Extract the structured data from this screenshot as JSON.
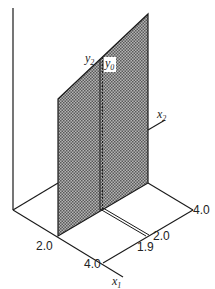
{
  "figure": {
    "colors": {
      "line": "#1a1a1a",
      "plane_fill": "#9a9a9a",
      "background": "#ffffff"
    },
    "labels": {
      "y2": {
        "base": "y",
        "sub": "2"
      },
      "y0": {
        "base": "y",
        "sub": "0"
      },
      "x2": {
        "base": "x",
        "sub": "2"
      },
      "x1": {
        "base": "x",
        "sub": "1"
      },
      "front_tick_2": "2.0",
      "front_tick_4": "4.0",
      "right_tick_4": "4.0",
      "right_tick_2": "2.0",
      "right_tick_19": "1.9"
    }
  }
}
